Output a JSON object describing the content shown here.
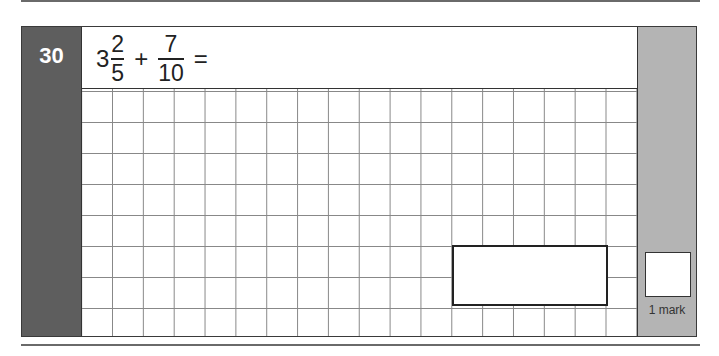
{
  "question": {
    "number": "30",
    "expression": {
      "whole": "3",
      "frac1": {
        "numerator": "2",
        "denominator": "5"
      },
      "operator": "+",
      "frac2": {
        "numerator": "7",
        "denominator": "10"
      },
      "equals": "="
    }
  },
  "working_grid": {
    "columns": 18,
    "rows": 8
  },
  "answer_box": {
    "value": ""
  },
  "marks": {
    "label": "1 mark",
    "score": ""
  },
  "colors": {
    "number_panel": "#5e5e5e",
    "mark_column": "#b4b4b4"
  }
}
